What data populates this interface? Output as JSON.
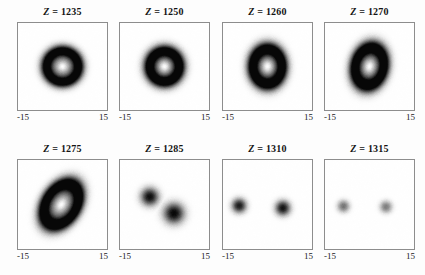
{
  "figure": {
    "background": "#ffffff",
    "rows": 2,
    "cols": 4,
    "axis_label_min": "-15",
    "axis_label_max": "15",
    "title_prefix": "Z",
    "title_separator": " = "
  },
  "chart_data": {
    "type": "heatmap",
    "title": "",
    "xlabel": "",
    "ylabel": "",
    "xlim": [
      -15,
      15
    ],
    "ylim": [
      -15,
      15
    ],
    "colormap": "gray_inverted",
    "note": "Dark regions correspond to high intensity on white background",
    "panels": [
      {
        "label": "Z = 1235",
        "z": 1235,
        "shape": "annular-ring",
        "xlabel_min": "-15",
        "xlabel_max": "15",
        "ring_radius": 5.6,
        "ring_thickness": 3.4,
        "ellipticity": 1.0,
        "rotation_deg": 0,
        "center": [
          0,
          0
        ],
        "peak_darkness": 0.93,
        "core_bright": true
      },
      {
        "label": "Z = 1250",
        "z": 1250,
        "shape": "annular-ring",
        "xlabel_min": "-15",
        "xlabel_max": "15",
        "ring_radius": 5.3,
        "ring_thickness": 3.6,
        "ellipticity": 1.05,
        "rotation_deg": 0,
        "center": [
          0,
          0
        ],
        "peak_darkness": 0.94,
        "core_bright": true
      },
      {
        "label": "Z = 1260",
        "z": 1260,
        "shape": "annular-ring",
        "xlabel_min": "-15",
        "xlabel_max": "15",
        "ring_radius": 5.2,
        "ring_thickness": 3.5,
        "ellipticity": 1.22,
        "rotation_deg": 0,
        "center": [
          0,
          0
        ],
        "peak_darkness": 0.95,
        "core_bright": true
      },
      {
        "label": "Z = 1270",
        "z": 1270,
        "shape": "annular-ring",
        "xlabel_min": "-15",
        "xlabel_max": "15",
        "ring_radius": 5.1,
        "ring_thickness": 3.4,
        "ellipticity": 1.35,
        "rotation_deg": 12,
        "center": [
          0,
          0
        ],
        "peak_darkness": 0.95,
        "core_bright": true
      },
      {
        "label": "Z = 1275",
        "z": 1275,
        "shape": "tilted-elliptic-ring",
        "xlabel_min": "-15",
        "xlabel_max": "15",
        "ring_radius": 5.4,
        "ring_thickness": 3.3,
        "ellipticity": 1.45,
        "rotation_deg": 32,
        "center": [
          -0.4,
          0
        ],
        "peak_darkness": 0.96,
        "core_bright": true
      },
      {
        "label": "Z = 1285",
        "z": 1285,
        "shape": "split-two-lobes",
        "xlabel_min": "-15",
        "xlabel_max": "15",
        "lobes": [
          {
            "center": [
              -5.0,
              -2.6
            ],
            "radius": 3.1,
            "darkness": 0.93
          },
          {
            "center": [
              3.2,
              3.0
            ],
            "radius": 3.6,
            "darkness": 0.96
          }
        ],
        "core_bright": false
      },
      {
        "label": "Z = 1310",
        "z": 1310,
        "shape": "two-spots",
        "xlabel_min": "-15",
        "xlabel_max": "15",
        "lobes": [
          {
            "center": [
              -9.6,
              0.4
            ],
            "radius": 2.5,
            "darkness": 0.92
          },
          {
            "center": [
              5.2,
              1.2
            ],
            "radius": 2.6,
            "darkness": 0.95
          }
        ],
        "core_bright": false
      },
      {
        "label": "Z = 1315",
        "z": 1315,
        "shape": "two-spots",
        "xlabel_min": "-15",
        "xlabel_max": "15",
        "lobes": [
          {
            "center": [
              -8.8,
              0.6
            ],
            "radius": 2.1,
            "darkness": 0.55
          },
          {
            "center": [
              5.6,
              0.8
            ],
            "radius": 2.1,
            "darkness": 0.52
          }
        ],
        "core_bright": false
      }
    ]
  }
}
